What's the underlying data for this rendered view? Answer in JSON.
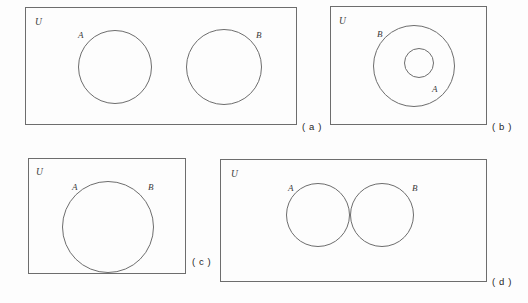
{
  "figure": {
    "width": 528,
    "height": 303,
    "background_color": "#fdfdfd",
    "line_color": "#6d6d6d",
    "text_color": "#3a3a3a"
  },
  "panels": [
    {
      "id": "panel-a",
      "caption": "( a )",
      "universe_label": "U",
      "relation": "disjoint",
      "box": {
        "x": 25,
        "y": 7,
        "w": 272,
        "h": 118
      },
      "caption_pos": {
        "x": 302,
        "y": 122
      },
      "universe_pos": {
        "x": 35,
        "y": 18
      },
      "circles": [
        {
          "label": "A",
          "cx": 115,
          "cy": 67,
          "r": 37,
          "label_x": 78,
          "label_y": 31
        },
        {
          "label": "B",
          "cx": 224,
          "cy": 67,
          "r": 38,
          "label_x": 256,
          "label_y": 31
        }
      ]
    },
    {
      "id": "panel-b",
      "caption": "( b )",
      "universe_label": "U",
      "relation": "subset",
      "box": {
        "x": 330,
        "y": 6,
        "w": 157,
        "h": 119
      },
      "caption_pos": {
        "x": 492,
        "y": 122
      },
      "universe_pos": {
        "x": 339,
        "y": 17
      },
      "circles": [
        {
          "label": "B",
          "cx": 414,
          "cy": 66,
          "r": 41,
          "label_x": 377,
          "label_y": 30
        },
        {
          "label": "A",
          "cx": 419,
          "cy": 63,
          "r": 15,
          "label_x": 432,
          "label_y": 85
        }
      ]
    },
    {
      "id": "panel-c",
      "caption": "( c )",
      "universe_label": "U",
      "relation": "equal",
      "box": {
        "x": 28,
        "y": 158,
        "w": 158,
        "h": 116
      },
      "caption_pos": {
        "x": 192,
        "y": 257
      },
      "universe_pos": {
        "x": 36,
        "y": 168
      },
      "circles": [
        {
          "label": "A",
          "cx": 108,
          "cy": 227,
          "r": 46,
          "label_x": 72,
          "label_y": 183
        },
        {
          "label": "B",
          "cx": 108,
          "cy": 227,
          "r": 46,
          "label_x": 148,
          "label_y": 183
        }
      ]
    },
    {
      "id": "panel-d",
      "caption": "( d )",
      "universe_label": "U",
      "relation": "intersecting",
      "box": {
        "x": 220,
        "y": 159,
        "w": 267,
        "h": 123
      },
      "caption_pos": {
        "x": 492,
        "y": 277
      },
      "universe_pos": {
        "x": 231,
        "y": 170
      },
      "circles": [
        {
          "label": "A",
          "cx": 318,
          "cy": 215,
          "r": 32,
          "label_x": 288,
          "label_y": 184
        },
        {
          "label": "B",
          "cx": 382,
          "cy": 215,
          "r": 32,
          "label_x": 412,
          "label_y": 184
        }
      ]
    }
  ]
}
